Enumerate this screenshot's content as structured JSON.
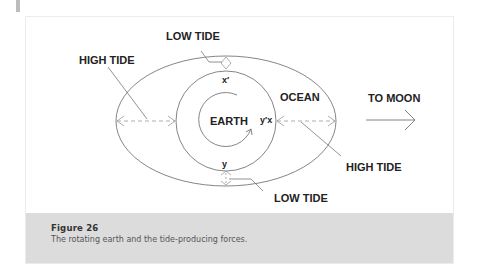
{
  "labels": {
    "low_tide_top": "LOW TIDE",
    "high_tide_left": "HIGH TIDE",
    "earth": "EARTH",
    "ocean": "OCEAN",
    "to_moon": "TO MOON",
    "high_tide_right": "HIGH TIDE",
    "low_tide_bottom": "LOW TIDE",
    "point_x_prime": "x′",
    "point_y_prime_x": "y′x",
    "point_y": "y"
  },
  "caption": {
    "title": "Figure 26",
    "text": "The rotating earth and the tide-producing forces."
  },
  "colors": {
    "line": "#777777",
    "caption_bg": "#dcdcdc"
  }
}
